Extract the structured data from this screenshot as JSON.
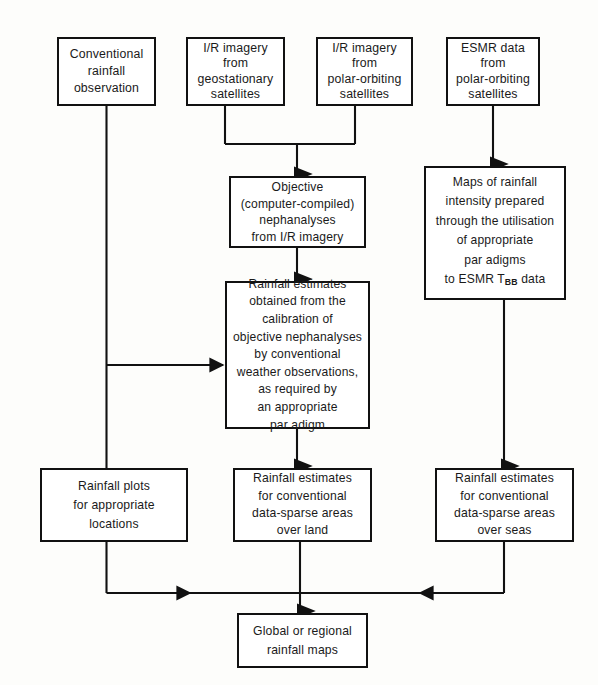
{
  "diagram": {
    "background_color": "#fdfdfb",
    "line_color": "#111111",
    "box_fill": "#ffffff",
    "nodes": {
      "conventional": "Conventional\nrainfall\nobservation",
      "ir_geo": "I/R imagery\nfrom\ngeostationary\nsatellites",
      "ir_polar": "I/R imagery\nfrom\npolar-orbiting\nsatellites",
      "esmr": "ESMR data\nfrom\npolar-orbiting\nsatellites",
      "objective": "Objective\n(computer-compiled)\nnephanalyses\nfrom I/R imagery",
      "maps_line1": "Maps of rainfall",
      "maps_line2": "intensity prepared",
      "maps_line3": "through the utilisation",
      "maps_line4": "of    appropriate",
      "maps_line5": "par adigms",
      "maps_line6_pre": "to ESMR T",
      "maps_line6_sub": "BB",
      "maps_line6_post": " data",
      "calibration": "Rainfall estimates\nobtained from the\ncalibration of\nobjective nephanalyses\nby conventional\nweather observations,\nas required by\nan appropriate\npar adigm",
      "plots": "Rainfall plots\nfor appropriate\nlocations",
      "land": "Rainfall estimates\nfor conventional\ndata-sparse areas\nover land",
      "seas": "Rainfall estimates\nfor conventional\ndata-sparse areas\nover seas",
      "global": "Global or regional\nrainfall maps"
    },
    "edges": [
      {
        "name": "conventional-to-calibration",
        "from": "conventional",
        "to": "calibration",
        "style": "elbow-down-right",
        "arrow": "both"
      },
      {
        "name": "conventional-to-plots",
        "from": "conventional",
        "to": "plots",
        "style": "straight-down",
        "arrow": "none"
      },
      {
        "name": "ir-geo-to-junction",
        "from": "ir_geo",
        "to": "objective",
        "style": "merge-down",
        "arrow": "none"
      },
      {
        "name": "ir-polar-to-junction",
        "from": "ir_polar",
        "to": "objective",
        "style": "merge-down",
        "arrow": "none"
      },
      {
        "name": "junction-to-objective",
        "from": "junction",
        "to": "objective",
        "style": "straight-down",
        "arrow": "end"
      },
      {
        "name": "objective-to-calibration",
        "from": "objective",
        "to": "calibration",
        "style": "straight-down",
        "arrow": "end"
      },
      {
        "name": "calibration-to-land",
        "from": "calibration",
        "to": "land",
        "style": "straight-down",
        "arrow": "end"
      },
      {
        "name": "esmr-to-maps",
        "from": "esmr",
        "to": "maps",
        "style": "straight-down",
        "arrow": "end"
      },
      {
        "name": "maps-to-seas",
        "from": "maps",
        "to": "seas",
        "style": "straight-down",
        "arrow": "end"
      },
      {
        "name": "plots-to-global-bus",
        "from": "plots",
        "to": "global",
        "style": "elbow-down-right",
        "arrow": "end"
      },
      {
        "name": "land-to-global",
        "from": "land",
        "to": "global",
        "style": "straight-down",
        "arrow": "end"
      },
      {
        "name": "seas-to-global-bus",
        "from": "seas",
        "to": "global",
        "style": "elbow-down-left",
        "arrow": "end"
      }
    ]
  }
}
